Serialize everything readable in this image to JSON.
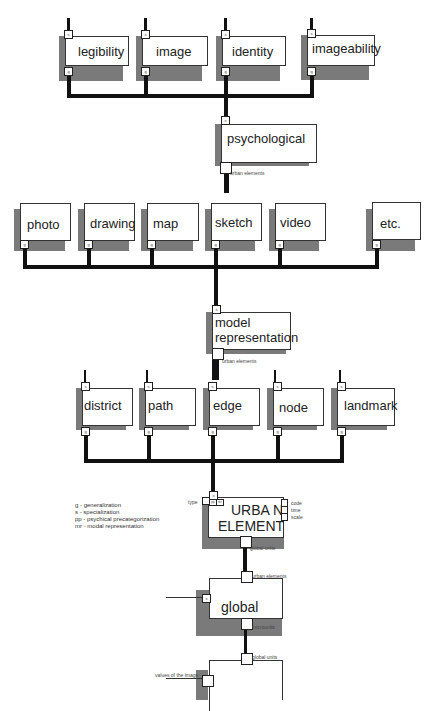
{
  "diagram": {
    "row1": {
      "boxes": [
        {
          "label": "legibility",
          "top_port": "s",
          "bottom_port": "g"
        },
        {
          "label": "image",
          "top_port": "s",
          "bottom_port": "g"
        },
        {
          "label": "identity",
          "top_port": "s",
          "bottom_port": "g"
        },
        {
          "label": "imageability",
          "top_port": "s",
          "bottom_port": "g"
        }
      ]
    },
    "psychological": {
      "label": "psychological",
      "top_port": "s",
      "port_caption": "urban elements"
    },
    "row2": {
      "boxes": [
        {
          "label": "photo",
          "bottom_port": "g"
        },
        {
          "label": "drawing",
          "bottom_port": "g"
        },
        {
          "label": "map",
          "bottom_port": "g"
        },
        {
          "label": "sketch",
          "bottom_port": "g"
        },
        {
          "label": "video",
          "bottom_port": "g"
        },
        {
          "label": "etc.",
          "bottom_port": "g"
        }
      ]
    },
    "model_representation": {
      "label_line1": "model",
      "label_line2": "representation",
      "top_port": "s",
      "port_caption": "urban elements"
    },
    "row3": {
      "boxes": [
        {
          "label": "district",
          "top_port": "s",
          "bottom_port": "g"
        },
        {
          "label": "path",
          "top_port": "s",
          "bottom_port": "g"
        },
        {
          "label": "edge",
          "top_port": "s",
          "bottom_port": "g"
        },
        {
          "label": "node",
          "top_port": "s",
          "bottom_port": "g"
        },
        {
          "label": "landmark",
          "top_port": "s",
          "bottom_port": "g"
        }
      ]
    },
    "urban_element": {
      "label_line1": "URBA N",
      "label_line2": "ELEMENT",
      "top_port": "s",
      "left_caption": "type",
      "top_ports": [
        "pp",
        "mr"
      ],
      "right_ports": [
        "code",
        "time",
        "scale"
      ],
      "bottom_caption": "global units"
    },
    "legend": [
      "g  - generalization",
      "s  - specialization",
      "pp - psychical precategorization",
      "mr - modal representation"
    ],
    "global": {
      "label": "global",
      "top_caption": "urban elements",
      "left_port": "s",
      "bottom_caption": "microunits"
    },
    "bottom_box": {
      "top_caption": "global units",
      "left_caption": "values of the image"
    }
  }
}
